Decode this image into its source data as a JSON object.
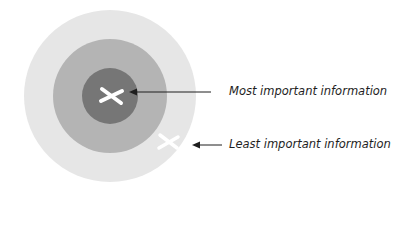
{
  "diagram": {
    "labels": {
      "most": "Most important information",
      "least": "Least important information"
    },
    "colors": {
      "outer_ring": "#e6e6e6",
      "middle_ring": "#b4b4b4",
      "inner_circle": "#767676",
      "marker": "#ffffff",
      "arrow": "#1e1e1e"
    }
  }
}
